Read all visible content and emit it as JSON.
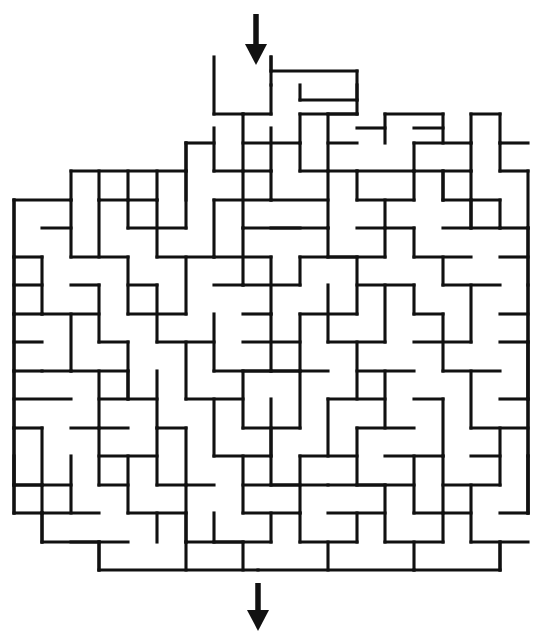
{
  "canvas": {
    "width": 542,
    "height": 640,
    "background": "#ffffff"
  },
  "maze": {
    "type": "rectangular-grid-maze",
    "wall_color": "#111111",
    "wall_thickness": 3.1,
    "cell_size": 28.5,
    "origin_x": 14,
    "origin_y": 57,
    "columns": 18,
    "rows": 18,
    "entrance": {
      "label": "entrance-top",
      "x": 256,
      "grid_column": 8,
      "side": "top"
    },
    "exit": {
      "label": "exit-bottom",
      "x": 258,
      "grid_column": 8,
      "side": "bottom"
    },
    "arrows": [
      {
        "name": "entrance-arrow",
        "x": 256,
        "y_start": 14,
        "y_end": 44,
        "head_y": 44,
        "head_size": 11,
        "direction": "down"
      },
      {
        "name": "exit-arrow",
        "x": 258,
        "y_start": 583,
        "y_end": 610,
        "head_y": 610,
        "head_size": 11,
        "direction": "down"
      }
    ],
    "segments": [
      [
        214,
        57,
        214,
        114
      ],
      [
        271,
        57,
        271,
        71
      ],
      [
        271,
        71,
        357,
        71
      ],
      [
        357,
        71,
        357,
        114
      ],
      [
        300,
        85,
        300,
        100
      ],
      [
        300,
        100,
        357,
        100
      ],
      [
        271,
        85,
        271,
        114
      ],
      [
        243,
        114,
        271,
        114
      ],
      [
        300,
        114,
        357,
        114
      ],
      [
        243,
        114,
        243,
        171
      ],
      [
        300,
        114,
        300,
        143
      ],
      [
        186,
        143,
        214,
        143
      ],
      [
        186,
        143,
        186,
        200
      ],
      [
        214,
        128,
        214,
        171
      ],
      [
        271,
        128,
        271,
        171
      ],
      [
        243,
        143,
        300,
        143
      ],
      [
        300,
        143,
        300,
        171
      ],
      [
        328,
        114,
        328,
        171
      ],
      [
        328,
        143,
        357,
        143
      ],
      [
        71,
        171,
        186,
        171
      ],
      [
        214,
        171,
        271,
        171
      ],
      [
        300,
        171,
        357,
        171
      ],
      [
        357,
        171,
        414,
        171
      ],
      [
        414,
        171,
        414,
        200
      ],
      [
        443,
        171,
        443,
        200
      ],
      [
        414,
        171,
        471,
        171
      ],
      [
        471,
        171,
        471,
        200
      ],
      [
        99,
        171,
        99,
        200
      ],
      [
        128,
        171,
        128,
        200
      ],
      [
        157,
        171,
        157,
        200
      ],
      [
        186,
        171,
        186,
        228
      ],
      [
        243,
        171,
        243,
        228
      ],
      [
        271,
        171,
        271,
        200
      ],
      [
        328,
        171,
        328,
        228
      ],
      [
        357,
        171,
        357,
        200
      ],
      [
        14,
        200,
        71,
        200
      ],
      [
        71,
        200,
        71,
        257
      ],
      [
        99,
        200,
        99,
        257
      ],
      [
        128,
        200,
        128,
        228
      ],
      [
        157,
        200,
        157,
        257
      ],
      [
        214,
        200,
        271,
        200
      ],
      [
        214,
        200,
        214,
        257
      ],
      [
        271,
        200,
        328,
        200
      ],
      [
        357,
        200,
        414,
        200
      ],
      [
        385,
        200,
        385,
        228
      ],
      [
        443,
        200,
        500,
        200
      ],
      [
        471,
        200,
        471,
        228
      ],
      [
        500,
        200,
        500,
        228
      ],
      [
        14,
        200,
        14,
        257
      ],
      [
        42,
        228,
        71,
        228
      ],
      [
        128,
        228,
        186,
        228
      ],
      [
        243,
        228,
        243,
        285
      ],
      [
        271,
        228,
        328,
        228
      ],
      [
        328,
        228,
        328,
        257
      ],
      [
        357,
        228,
        414,
        228
      ],
      [
        414,
        228,
        414,
        257
      ],
      [
        443,
        228,
        500,
        228
      ],
      [
        500,
        228,
        528,
        228
      ],
      [
        385,
        228,
        385,
        257
      ],
      [
        14,
        257,
        42,
        257
      ],
      [
        42,
        257,
        42,
        314
      ],
      [
        71,
        257,
        128,
        257
      ],
      [
        128,
        257,
        128,
        314
      ],
      [
        157,
        257,
        214,
        257
      ],
      [
        186,
        257,
        186,
        314
      ],
      [
        214,
        257,
        271,
        257
      ],
      [
        271,
        257,
        271,
        314
      ],
      [
        300,
        257,
        357,
        257
      ],
      [
        300,
        257,
        300,
        285
      ],
      [
        357,
        257,
        357,
        314
      ],
      [
        414,
        257,
        471,
        257
      ],
      [
        443,
        257,
        443,
        285
      ],
      [
        500,
        257,
        528,
        257
      ],
      [
        528,
        228,
        528,
        285
      ],
      [
        14,
        257,
        14,
        314
      ],
      [
        14,
        285,
        42,
        285
      ],
      [
        71,
        285,
        99,
        285
      ],
      [
        99,
        285,
        99,
        342
      ],
      [
        128,
        285,
        157,
        285
      ],
      [
        157,
        285,
        157,
        342
      ],
      [
        214,
        285,
        243,
        285
      ],
      [
        243,
        285,
        300,
        285
      ],
      [
        328,
        285,
        328,
        342
      ],
      [
        357,
        285,
        414,
        285
      ],
      [
        385,
        285,
        385,
        342
      ],
      [
        414,
        285,
        414,
        314
      ],
      [
        443,
        285,
        500,
        285
      ],
      [
        471,
        285,
        471,
        342
      ],
      [
        14,
        314,
        14,
        371
      ],
      [
        42,
        314,
        99,
        314
      ],
      [
        71,
        314,
        71,
        371
      ],
      [
        128,
        314,
        186,
        314
      ],
      [
        214,
        314,
        214,
        371
      ],
      [
        243,
        314,
        271,
        314
      ],
      [
        271,
        314,
        271,
        371
      ],
      [
        300,
        314,
        357,
        314
      ],
      [
        300,
        314,
        300,
        371
      ],
      [
        414,
        314,
        443,
        314
      ],
      [
        443,
        314,
        443,
        371
      ],
      [
        500,
        314,
        528,
        314
      ],
      [
        528,
        285,
        528,
        342
      ],
      [
        14,
        342,
        42,
        342
      ],
      [
        99,
        342,
        128,
        342
      ],
      [
        128,
        342,
        128,
        399
      ],
      [
        157,
        342,
        214,
        342
      ],
      [
        186,
        342,
        186,
        399
      ],
      [
        243,
        342,
        300,
        342
      ],
      [
        328,
        342,
        385,
        342
      ],
      [
        357,
        342,
        357,
        399
      ],
      [
        414,
        342,
        471,
        342
      ],
      [
        500,
        342,
        528,
        342
      ],
      [
        14,
        371,
        14,
        428
      ],
      [
        42,
        371,
        71,
        371
      ],
      [
        71,
        371,
        128,
        371
      ],
      [
        99,
        371,
        99,
        428
      ],
      [
        157,
        371,
        157,
        428
      ],
      [
        214,
        371,
        271,
        371
      ],
      [
        243,
        371,
        243,
        428
      ],
      [
        271,
        371,
        328,
        371
      ],
      [
        300,
        371,
        300,
        428
      ],
      [
        357,
        371,
        414,
        371
      ],
      [
        385,
        371,
        385,
        428
      ],
      [
        443,
        371,
        500,
        371
      ],
      [
        471,
        371,
        471,
        428
      ],
      [
        528,
        342,
        528,
        399
      ],
      [
        14,
        399,
        71,
        399
      ],
      [
        99,
        399,
        157,
        399
      ],
      [
        186,
        399,
        243,
        399
      ],
      [
        214,
        399,
        214,
        456
      ],
      [
        271,
        399,
        271,
        456
      ],
      [
        328,
        399,
        385,
        399
      ],
      [
        328,
        399,
        328,
        456
      ],
      [
        414,
        399,
        443,
        399
      ],
      [
        443,
        399,
        443,
        456
      ],
      [
        500,
        399,
        528,
        399
      ],
      [
        14,
        428,
        42,
        428
      ],
      [
        42,
        428,
        42,
        485
      ],
      [
        71,
        428,
        128,
        428
      ],
      [
        157,
        428,
        186,
        428
      ],
      [
        186,
        428,
        186,
        485
      ],
      [
        243,
        428,
        300,
        428
      ],
      [
        271,
        428,
        271,
        485
      ],
      [
        357,
        428,
        414,
        428
      ],
      [
        357,
        428,
        357,
        485
      ],
      [
        471,
        428,
        528,
        428
      ],
      [
        500,
        428,
        500,
        485
      ],
      [
        528,
        399,
        528,
        456
      ],
      [
        14,
        456,
        14,
        513
      ],
      [
        71,
        456,
        71,
        513
      ],
      [
        99,
        456,
        157,
        456
      ],
      [
        128,
        456,
        128,
        513
      ],
      [
        214,
        456,
        271,
        456
      ],
      [
        243,
        456,
        243,
        513
      ],
      [
        300,
        456,
        357,
        456
      ],
      [
        300,
        456,
        300,
        513
      ],
      [
        385,
        456,
        443,
        456
      ],
      [
        414,
        456,
        414,
        513
      ],
      [
        471,
        456,
        500,
        456
      ],
      [
        14,
        485,
        71,
        485
      ],
      [
        99,
        485,
        128,
        485
      ],
      [
        157,
        485,
        214,
        485
      ],
      [
        186,
        485,
        186,
        542
      ],
      [
        243,
        485,
        300,
        485
      ],
      [
        328,
        485,
        385,
        485
      ],
      [
        357,
        485,
        414,
        485
      ],
      [
        443,
        485,
        500,
        485
      ],
      [
        471,
        485,
        471,
        542
      ],
      [
        528,
        456,
        528,
        513
      ],
      [
        42,
        513,
        99,
        513
      ],
      [
        128,
        513,
        186,
        513
      ],
      [
        157,
        513,
        157,
        542
      ],
      [
        214,
        513,
        214,
        542
      ],
      [
        243,
        513,
        300,
        513
      ],
      [
        271,
        513,
        271,
        542
      ],
      [
        328,
        513,
        385,
        513
      ],
      [
        357,
        513,
        357,
        542
      ],
      [
        414,
        513,
        471,
        513
      ],
      [
        443,
        513,
        443,
        542
      ],
      [
        500,
        513,
        528,
        513
      ],
      [
        14,
        513,
        42,
        513
      ],
      [
        42,
        513,
        42,
        542
      ],
      [
        71,
        542,
        128,
        542
      ],
      [
        99,
        542,
        99,
        570
      ],
      [
        214,
        542,
        271,
        542
      ],
      [
        300,
        542,
        357,
        542
      ],
      [
        385,
        542,
        443,
        542
      ],
      [
        414,
        542,
        414,
        570
      ],
      [
        471,
        542,
        528,
        542
      ],
      [
        500,
        542,
        500,
        570
      ],
      [
        186,
        542,
        243,
        542
      ],
      [
        243,
        542,
        243,
        570
      ],
      [
        328,
        542,
        328,
        570
      ],
      [
        42,
        542,
        99,
        542
      ],
      [
        99,
        570,
        258,
        570
      ],
      [
        258,
        570,
        414,
        570
      ],
      [
        414,
        570,
        500,
        570
      ],
      [
        14,
        200,
        14,
        513
      ],
      [
        528,
        228,
        528,
        513
      ],
      [
        71,
        171,
        71,
        200
      ],
      [
        186,
        143,
        186,
        171
      ],
      [
        214,
        114,
        243,
        114
      ],
      [
        443,
        171,
        443,
        200
      ],
      [
        471,
        200,
        471,
        228
      ],
      [
        99,
        570,
        99,
        542
      ],
      [
        500,
        570,
        500,
        542
      ],
      [
        42,
        542,
        42,
        513
      ],
      [
        186,
        513,
        186,
        542
      ],
      [
        186,
        542,
        186,
        570
      ],
      [
        271,
        57,
        271,
        85
      ],
      [
        357,
        85,
        357,
        100
      ],
      [
        14,
        314,
        42,
        314
      ],
      [
        14,
        371,
        42,
        371
      ],
      [
        14,
        428,
        14,
        485
      ],
      [
        528,
        342,
        528,
        399
      ],
      [
        528,
        456,
        528,
        513
      ],
      [
        99,
        200,
        157,
        200
      ],
      [
        328,
        114,
        357,
        114
      ],
      [
        414,
        143,
        471,
        143
      ],
      [
        414,
        143,
        414,
        171
      ],
      [
        471,
        143,
        471,
        171
      ],
      [
        385,
        114,
        443,
        114
      ],
      [
        385,
        114,
        385,
        143
      ],
      [
        443,
        114,
        443,
        143
      ],
      [
        500,
        143,
        528,
        143
      ],
      [
        500,
        143,
        500,
        171
      ],
      [
        471,
        114,
        500,
        114
      ],
      [
        471,
        114,
        471,
        143
      ],
      [
        500,
        171,
        528,
        171
      ],
      [
        528,
        171,
        528,
        228
      ],
      [
        500,
        114,
        500,
        143
      ],
      [
        357,
        128,
        385,
        128
      ],
      [
        414,
        128,
        443,
        128
      ],
      [
        14,
        485,
        42,
        485
      ],
      [
        42,
        485,
        42,
        513
      ],
      [
        243,
        228,
        300,
        228
      ],
      [
        328,
        257,
        385,
        257
      ],
      [
        99,
        428,
        99,
        485
      ],
      [
        157,
        428,
        157,
        485
      ],
      [
        385,
        485,
        385,
        542
      ],
      [
        443,
        456,
        443,
        513
      ],
      [
        271,
        485,
        328,
        485
      ],
      [
        300,
        513,
        300,
        542
      ],
      [
        128,
        371,
        128,
        399
      ],
      [
        243,
        371,
        300,
        371
      ]
    ]
  }
}
